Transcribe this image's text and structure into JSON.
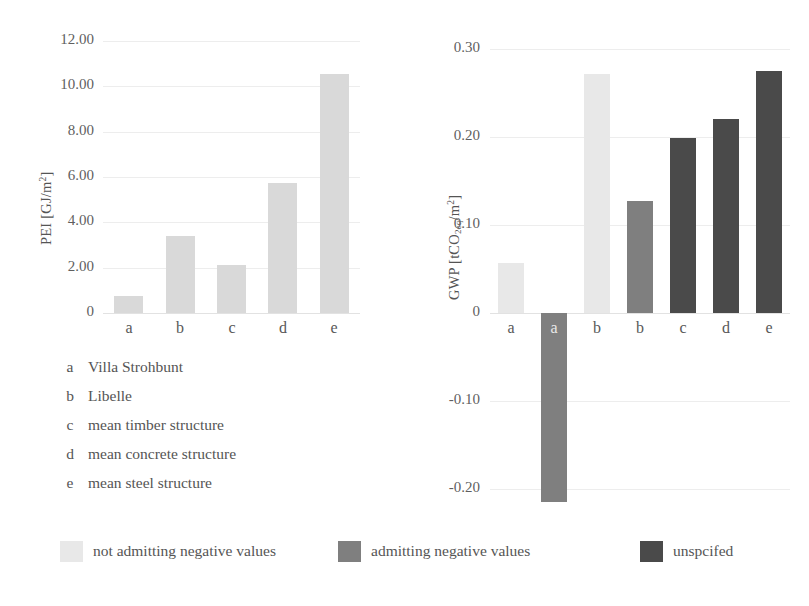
{
  "figure": {
    "background": "#ffffff",
    "width": 809,
    "height": 606
  },
  "colors": {
    "series_not_admitting": "#e8e8e8",
    "series_admitting": "#7f7f7f",
    "series_unspecified": "#4a4a4a",
    "left_bars": "#d9d9d9",
    "gridline": "#ededed",
    "text": "#555555"
  },
  "key": {
    "items": [
      {
        "letter": "a",
        "label": "Villa Strohbunt"
      },
      {
        "letter": "b",
        "label": "Libelle"
      },
      {
        "letter": "c",
        "label": "mean timber structure"
      },
      {
        "letter": "d",
        "label": "mean concrete structure"
      },
      {
        "letter": "e",
        "label": "mean steel structure"
      }
    ]
  },
  "legend": {
    "position": "bottom",
    "items": [
      {
        "label": "not admitting negative values",
        "color": "#e8e8e8"
      },
      {
        "label": "admitting negative values",
        "color": "#7f7f7f"
      },
      {
        "label": "unspcifed",
        "color": "#4a4a4a"
      }
    ]
  },
  "chart_data": [
    {
      "id": "pei",
      "type": "bar",
      "title": "",
      "xlabel": "",
      "ylabel": "PEI [GJ/m²]",
      "ylabel_parts": {
        "prefix": "PEI [GJ/m",
        "sup": "2",
        "suffix": "]"
      },
      "ylim": [
        0,
        12
      ],
      "yticks": [
        0,
        2,
        4,
        6,
        8,
        10,
        12
      ],
      "ytick_labels": [
        "0",
        "2.00",
        "4.00",
        "6.00",
        "8.00",
        "10.00",
        "12.00"
      ],
      "grid": true,
      "categories": [
        "a",
        "b",
        "c",
        "d",
        "e"
      ],
      "values": [
        0.75,
        3.4,
        2.1,
        5.75,
        10.55
      ],
      "bar_colors": [
        "#d9d9d9",
        "#d9d9d9",
        "#d9d9d9",
        "#d9d9d9",
        "#d9d9d9"
      ],
      "series_names": [
        "not admitting negative values",
        "not admitting negative values",
        "not admitting negative values",
        "not admitting negative values",
        "not admitting negative values"
      ]
    },
    {
      "id": "gwp",
      "type": "bar",
      "title": "",
      "xlabel": "",
      "ylabel": "GWP [tCO2eq/m²]",
      "ylabel_parts": {
        "prefix": "GWP [tCO",
        "sub": "2eq",
        "mid": "/m",
        "sup": "2",
        "suffix": "]"
      },
      "ylim": [
        -0.23,
        0.3
      ],
      "yticks": [
        -0.2,
        -0.1,
        0,
        0.1,
        0.2,
        0.3
      ],
      "ytick_labels": [
        "-0.20",
        "-0.10",
        "0",
        "0.10",
        "0.20",
        "0.30"
      ],
      "grid": true,
      "categories": [
        "a",
        "a",
        "b",
        "b",
        "c",
        "d",
        "e"
      ],
      "values": [
        0.057,
        -0.215,
        0.272,
        0.127,
        0.199,
        0.221,
        0.275
      ],
      "bar_colors": [
        "#e8e8e8",
        "#7f7f7f",
        "#e8e8e8",
        "#7f7f7f",
        "#4a4a4a",
        "#4a4a4a",
        "#4a4a4a"
      ],
      "series_names": [
        "not admitting negative values",
        "admitting negative values",
        "not admitting negative values",
        "admitting negative values",
        "unspcifed",
        "unspcifed",
        "unspcifed"
      ]
    }
  ]
}
